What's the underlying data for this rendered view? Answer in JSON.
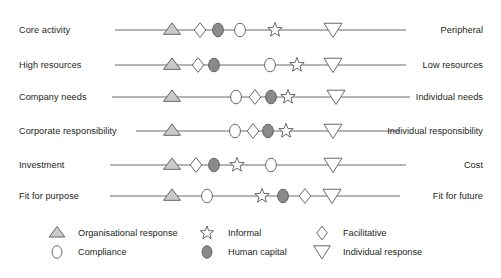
{
  "figure": {
    "title": "",
    "width": 501,
    "height": 278
  },
  "colors": {
    "line": "#58595b",
    "stroke": "#58595b",
    "text": "#231f20",
    "organisational_response_fill": "#c9c9c9",
    "human_capital_fill": "#8a8a8a",
    "open_fill": "#ffffff",
    "background": "#ffffff"
  },
  "chart_data": {
    "type": "scatter",
    "title": "",
    "xlabel": "",
    "ylabel": "",
    "xlim": [
      0,
      100
    ],
    "grid": false,
    "legend_position": "bottom",
    "series": [
      {
        "name": "Organisational response",
        "marker": "triangle-up",
        "fill": "#c9c9c9"
      },
      {
        "name": "Compliance",
        "marker": "ellipse-open",
        "fill": "#ffffff"
      },
      {
        "name": "Informal",
        "marker": "star",
        "fill": "#ffffff"
      },
      {
        "name": "Human capital",
        "marker": "ellipse-filled",
        "fill": "#8a8a8a"
      },
      {
        "name": "Facilitative",
        "marker": "diamond",
        "fill": "#ffffff"
      },
      {
        "name": "Individual response",
        "marker": "triangle-down",
        "fill": "#ffffff"
      }
    ],
    "rows": [
      {
        "left_label": "Core activity",
        "right_label": "Peripheral",
        "line_x1": 115,
        "line_x2": 406,
        "y": 30,
        "points": [
          {
            "series": "Organisational response",
            "x": 172
          },
          {
            "series": "Facilitative",
            "x": 200
          },
          {
            "series": "Human capital",
            "x": 218
          },
          {
            "series": "Compliance",
            "x": 240
          },
          {
            "series": "Informal",
            "x": 275
          },
          {
            "series": "Individual response",
            "x": 333
          }
        ]
      },
      {
        "left_label": "High resources",
        "right_label": "Low resources",
        "line_x1": 115,
        "line_x2": 406,
        "y": 65,
        "points": [
          {
            "series": "Organisational response",
            "x": 172
          },
          {
            "series": "Facilitative",
            "x": 198
          },
          {
            "series": "Human capital",
            "x": 214
          },
          {
            "series": "Compliance",
            "x": 270
          },
          {
            "series": "Informal",
            "x": 297
          },
          {
            "series": "Individual response",
            "x": 333
          }
        ]
      },
      {
        "left_label": "Company needs",
        "right_label": "Individual needs",
        "line_x1": 112,
        "line_x2": 410,
        "y": 97,
        "points": [
          {
            "series": "Organisational response",
            "x": 172
          },
          {
            "series": "Compliance",
            "x": 236
          },
          {
            "series": "Facilitative",
            "x": 255
          },
          {
            "series": "Human capital",
            "x": 271
          },
          {
            "series": "Informal",
            "x": 288
          },
          {
            "series": "Individual response",
            "x": 336
          }
        ]
      },
      {
        "left_label": "Corporate responsibility",
        "right_label": "Individual responsibility",
        "line_x1": 136,
        "line_x2": 400,
        "y": 131,
        "points": [
          {
            "series": "Organisational response",
            "x": 172
          },
          {
            "series": "Compliance",
            "x": 235
          },
          {
            "series": "Facilitative",
            "x": 253
          },
          {
            "series": "Human capital",
            "x": 268
          },
          {
            "series": "Informal",
            "x": 286
          },
          {
            "series": "Individual response",
            "x": 333
          }
        ]
      },
      {
        "left_label": "Investment",
        "right_label": "Cost",
        "line_x1": 110,
        "line_x2": 406,
        "y": 165,
        "points": [
          {
            "series": "Organisational response",
            "x": 172
          },
          {
            "series": "Facilitative",
            "x": 196
          },
          {
            "series": "Human capital",
            "x": 214
          },
          {
            "series": "Informal",
            "x": 237
          },
          {
            "series": "Compliance",
            "x": 271
          },
          {
            "series": "Individual response",
            "x": 333
          }
        ]
      },
      {
        "left_label": "Fit for purpose",
        "right_label": "Fit for future",
        "line_x1": 110,
        "line_x2": 400,
        "y": 196,
        "points": [
          {
            "series": "Organisational response",
            "x": 172
          },
          {
            "series": "Compliance",
            "x": 207
          },
          {
            "series": "Informal",
            "x": 262
          },
          {
            "series": "Human capital",
            "x": 283
          },
          {
            "series": "Facilitative",
            "x": 305
          },
          {
            "series": "Individual response",
            "x": 332
          }
        ]
      }
    ],
    "legend": [
      {
        "label": "Organisational response",
        "marker": "triangle-up",
        "col": 0,
        "row": 0
      },
      {
        "label": "Compliance",
        "marker": "ellipse-open",
        "col": 0,
        "row": 1
      },
      {
        "label": "Informal",
        "marker": "star",
        "col": 1,
        "row": 0
      },
      {
        "label": "Human capital",
        "marker": "ellipse-filled",
        "col": 1,
        "row": 1
      },
      {
        "label": "Facilitative",
        "marker": "diamond",
        "col": 2,
        "row": 0
      },
      {
        "label": "Individual response",
        "marker": "triangle-down",
        "col": 2,
        "row": 1
      }
    ]
  },
  "left_labels": [
    "Core activity",
    "High resources",
    "Company needs",
    "Corporate responsibility",
    "Investment",
    "Fit for purpose"
  ],
  "right_labels": [
    "Peripheral",
    "Low resources",
    "Individual needs",
    "Individual responsibility",
    "Cost",
    "Fit for future"
  ],
  "legend_labels": [
    "Organisational response",
    "Compliance",
    "Informal",
    "Human capital",
    "Facilitative",
    "Individual response"
  ]
}
